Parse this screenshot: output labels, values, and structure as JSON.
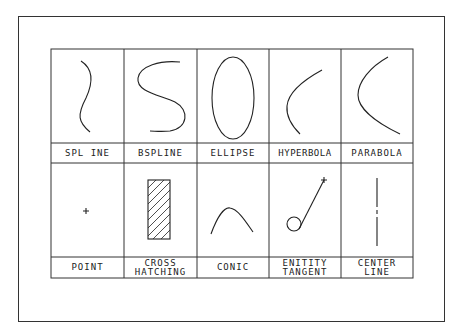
{
  "diagram": {
    "title": "",
    "type": "cad-entity-reference-table",
    "rows": [
      {
        "cells": [
          {
            "id": "spline",
            "label": "SPL INE",
            "figure": "s-curve"
          },
          {
            "id": "bspline",
            "label": "BSPLINE",
            "figure": "s-shape"
          },
          {
            "id": "ellipse",
            "label": "ELLIPSE",
            "figure": "ellipse"
          },
          {
            "id": "hyperbola",
            "label": "HYPERBOLA",
            "figure": "hyperbola-branch"
          },
          {
            "id": "parabola",
            "label": "PARABOLA",
            "figure": "parabola"
          }
        ]
      },
      {
        "cells": [
          {
            "id": "point",
            "label": "POINT",
            "figure": "plus-marker"
          },
          {
            "id": "cross-hatching",
            "label_line1": "CROSS",
            "label_line2": "HATCHING",
            "figure": "hatched-rectangle"
          },
          {
            "id": "conic",
            "label": "CONIC",
            "figure": "arc"
          },
          {
            "id": "entity-tangent",
            "label_line1": "ENITITY",
            "label_line2": "TANGENT",
            "figure": "circle-with-tangent-line"
          },
          {
            "id": "center-line",
            "label_line1": "CENTER",
            "label_line2": "LINE",
            "figure": "dashed-vertical-line"
          }
        ]
      }
    ],
    "colors": {
      "line": "#222222",
      "background": "#ffffff"
    }
  }
}
